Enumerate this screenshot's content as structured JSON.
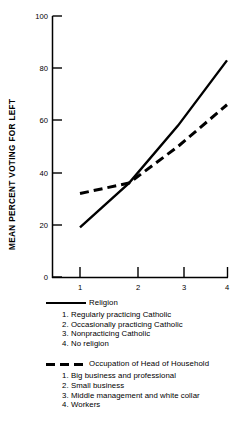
{
  "chart_data": {
    "type": "line",
    "title": "",
    "xlabel": "",
    "ylabel": "MEAN PERCENT VOTING FOR LEFT",
    "x": [
      1,
      2,
      3,
      4
    ],
    "xticklabels": [
      "1",
      "2",
      "3",
      "4"
    ],
    "yticklabels": [
      "0",
      "20",
      "40",
      "60",
      "80",
      "100"
    ],
    "yticks": [
      0,
      20,
      40,
      60,
      80,
      100
    ],
    "xlim": [
      0.55,
      4.0
    ],
    "ylim": [
      0,
      100
    ],
    "grid": false,
    "legend_position": "below-plot",
    "series": [
      {
        "name": "Religion",
        "style": "solid",
        "color": "#000000",
        "values": [
          19,
          36,
          58,
          83
        ]
      },
      {
        "name": "Occupation of Head of Household",
        "style": "dashed",
        "color": "#000000",
        "values": [
          32,
          36,
          50,
          66
        ]
      }
    ]
  },
  "axes": {
    "y_title": "MEAN PERCENT VOTING FOR LEFT",
    "y_ticks": [
      "100",
      "80",
      "60",
      "40",
      "20",
      "0"
    ],
    "x_ticks": [
      "1",
      "2",
      "3",
      "4"
    ]
  },
  "legend": {
    "groups": [
      {
        "swatch": "solid-line-swatch",
        "title": "Religion",
        "items": [
          {
            "num": "1.",
            "label": "Regularly practicing Catholic"
          },
          {
            "num": "2.",
            "label": "Occasionally practicing Catholic"
          },
          {
            "num": "3.",
            "label": "Nonpracticing Catholic"
          },
          {
            "num": "4.",
            "label": "No religion"
          }
        ]
      },
      {
        "swatch": "dashed-line-swatch",
        "title": "Occupation of Head of Household",
        "items": [
          {
            "num": "1.",
            "label": "Big business and professional"
          },
          {
            "num": "2.",
            "label": "Small business"
          },
          {
            "num": "3.",
            "label": "Middle management and white collar"
          },
          {
            "num": "4.",
            "label": "Workers"
          }
        ]
      }
    ]
  }
}
